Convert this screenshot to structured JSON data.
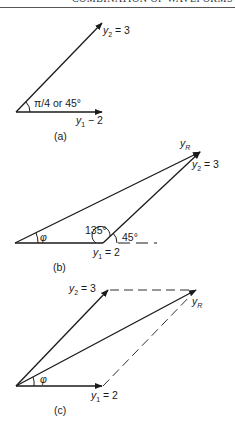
{
  "header": {
    "running_title": "COMBINATION OF WAVEFORMS"
  },
  "colors": {
    "ink": "#1a1a1a",
    "background": "#ffffff"
  },
  "figures": {
    "a": {
      "caption": "(a)",
      "y2": {
        "symbol": "y",
        "subscript": "2",
        "value_text": " = 3"
      },
      "y1": {
        "symbol": "y",
        "subscript": "1",
        "value_text": " − 2"
      },
      "angle_label": "π/4 or 45°"
    },
    "b": {
      "caption": "(b)",
      "yR": {
        "symbol": "y",
        "subscript": "R"
      },
      "y2": {
        "symbol": "y",
        "subscript": "2",
        "value_text": " = 3"
      },
      "y1": {
        "symbol": "y",
        "subscript": "1",
        "value_text": " = 2"
      },
      "phi": "φ",
      "angle_135": "135°",
      "angle_45": "45°"
    },
    "c": {
      "caption": "(c)",
      "yR": {
        "symbol": "y",
        "subscript": "R"
      },
      "y2": {
        "symbol": "y",
        "subscript": "2",
        "value_text": " = 3"
      },
      "y1": {
        "symbol": "y",
        "subscript": "1",
        "value_text": " = 2"
      },
      "phi": "φ"
    }
  }
}
